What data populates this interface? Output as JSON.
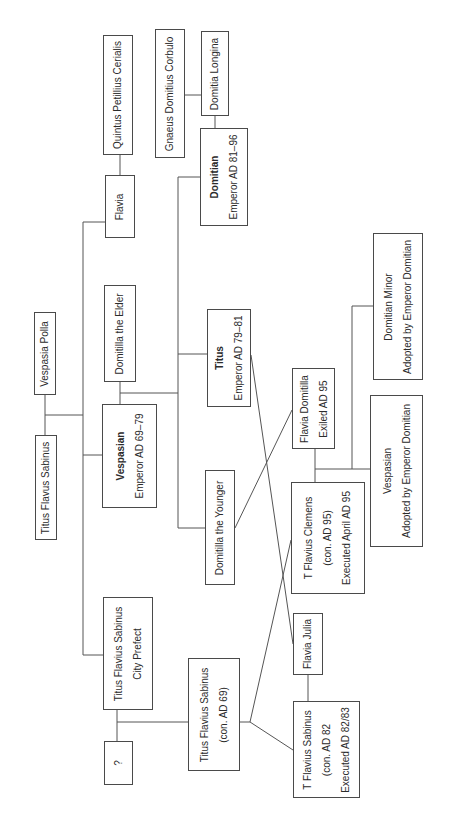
{
  "diagram": {
    "type": "family-tree",
    "orientation": "rotated-90-ccw",
    "line_color": "#555555",
    "box_border_color": "#4a4a4a",
    "nodes": {
      "quintus": {
        "lines": [
          "Quintus Petillius Cerialis"
        ]
      },
      "flavia": {
        "lines": [
          "Flavia"
        ]
      },
      "corbulo": {
        "lines": [
          "Gnaeus Domitius Corbulo"
        ]
      },
      "domitia_longina": {
        "lines": [
          "Domitia Longina"
        ]
      },
      "domitian": {
        "name": "Domitian",
        "lines": [
          "Emperor AD 81–96"
        ]
      },
      "vespasia_polla": {
        "lines": [
          "Vespasia Polla"
        ]
      },
      "titus_flavus_sabinus": {
        "lines": [
          "Titus Flavus Sabinus"
        ]
      },
      "domitilla_elder": {
        "lines": [
          "Domitilla the Elder"
        ]
      },
      "vespasian": {
        "name": "Vespasian",
        "lines": [
          "Emperor AD 69–79"
        ]
      },
      "titus": {
        "name": "Titus",
        "lines": [
          "Emperor AD 79–81"
        ]
      },
      "domitilla_younger": {
        "lines": [
          "Domitilla the Younger"
        ]
      },
      "sabinus_prefect": {
        "lines": [
          "Titus Flavius Sabinus",
          "City Prefect"
        ]
      },
      "unknown": {
        "lines": [
          "?"
        ]
      },
      "sabinus_con69": {
        "lines": [
          "Titus Flavius Sabinus",
          "(con. AD 69)"
        ]
      },
      "flavia_domitilla": {
        "lines": [
          "Flavia Domitilla",
          "Exiled AD 95"
        ]
      },
      "clemens": {
        "lines": [
          "T Flavius Clemens",
          "(con. AD 95)",
          "Executed April AD 95"
        ]
      },
      "flavia_julia": {
        "lines": [
          "Flavia Julia"
        ]
      },
      "sabinus_con82": {
        "lines": [
          "T Flavius Sabinus",
          "(con. AD 82",
          "Executed AD 82/83"
        ]
      },
      "vespasian_adopted": {
        "lines": [
          "Vespasian",
          "Adopted by Emperor Domitian"
        ]
      },
      "domitian_minor": {
        "lines": [
          "Domitian Minor",
          "Adopted by Emperor Domitian"
        ]
      }
    }
  }
}
